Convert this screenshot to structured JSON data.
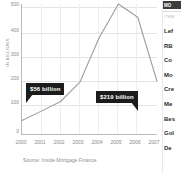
{
  "chart_data": {
    "type": "line",
    "title": "",
    "xlabel": "",
    "ylabel": "IN BILLIONS",
    "categories": [
      "2000",
      "2001",
      "2002",
      "2003",
      "2004",
      "2005",
      "2006",
      "2007"
    ],
    "x": [
      2000,
      2001,
      2002,
      2003,
      2004,
      2005,
      2006,
      2007
    ],
    "values": [
      56,
      95,
      135,
      215,
      400,
      540,
      485,
      219
    ],
    "series": [
      {
        "name": "Subprime mortgage originations",
        "values": [
          56,
          95,
          135,
          215,
          400,
          540,
          485,
          219
        ]
      }
    ],
    "ylim": [
      0,
      540
    ],
    "yticks": [
      0,
      100,
      200,
      300,
      400,
      500
    ],
    "ytick_labels": [
      "0",
      "100",
      "200",
      "300",
      "400",
      "500"
    ],
    "xlim": [
      2000,
      2007
    ],
    "grid": true,
    "legend": "none",
    "line_color": "#9e9e9e",
    "annotations": [
      {
        "label": "$56 billion",
        "x": 2000,
        "y": 56
      },
      {
        "label": "$219 billion",
        "x": 2007,
        "y": 219
      }
    ],
    "source": "Source: Inside Mortgage Finance"
  },
  "chart": {
    "ylabel": "IN BILLIONS",
    "ytick_0": "0",
    "ytick_100": "100",
    "ytick_200": "200",
    "ytick_300": "300",
    "ytick_400": "400",
    "ytick_500": "500",
    "callout_left": "$56 billion",
    "callout_right": "$219 billion",
    "source": "Source: Inside Mortgage Finance"
  },
  "sidebar": {
    "header_label": "MO",
    "section_label": "ITEM",
    "items": [
      {
        "label": "Lef"
      },
      {
        "label": "RB"
      },
      {
        "label": "Co"
      },
      {
        "label": "Mo"
      },
      {
        "label": "Cre"
      },
      {
        "label": "Me"
      },
      {
        "label": "Bes"
      },
      {
        "label": "Gol"
      },
      {
        "label": "De"
      }
    ]
  }
}
